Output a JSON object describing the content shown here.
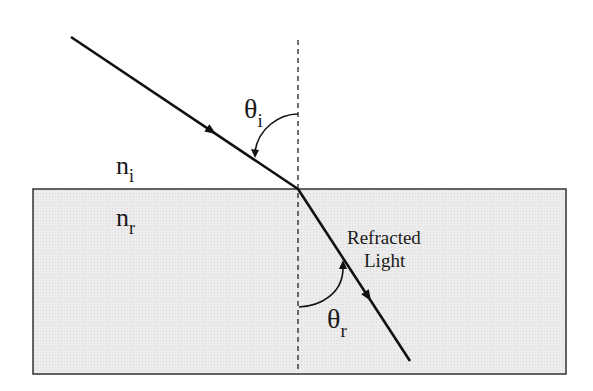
{
  "diagram": {
    "labels": {
      "theta_i_main": "θ",
      "theta_i_sub": "i",
      "theta_r_main": "θ",
      "theta_r_sub": "r",
      "n_i_main": "n",
      "n_i_sub": "i",
      "n_r_main": "n",
      "n_r_sub": "r",
      "refracted_line1": "Refracted",
      "refracted_line2": "Light"
    },
    "colors": {
      "line": "#111111",
      "medium_fill": "#e9e9e9",
      "medium_border": "#333333"
    }
  }
}
